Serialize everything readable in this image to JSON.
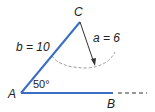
{
  "diagram": {
    "type": "triangle-ambiguous-case",
    "vertices": {
      "A": {
        "label": "A",
        "x": 21,
        "y": 93
      },
      "B": {
        "label": "B",
        "x": 112,
        "y": 93
      },
      "C": {
        "label": "C",
        "x": 80,
        "y": 22
      }
    },
    "sides": {
      "b": {
        "label": "b = 10",
        "from": "A",
        "to": "C"
      },
      "a": {
        "label": "a = 6",
        "from": "C",
        "to": "arc"
      }
    },
    "angle": {
      "label": "50°",
      "at": "A"
    },
    "colors": {
      "side_line": "#3a6fc4",
      "arrow": "#333333",
      "arc": "#9a9a9a",
      "text": "#222222"
    }
  }
}
